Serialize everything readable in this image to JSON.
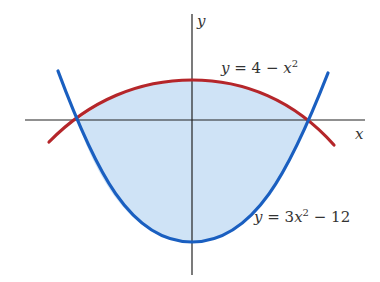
{
  "axes": {
    "x_label": "x",
    "y_label": "y"
  },
  "curves": [
    {
      "name": "upper",
      "equation_prefix": "y = 4 − ",
      "equation_var": "x",
      "equation_exp": "2",
      "equation_suffix": "",
      "color": "#b5262a"
    },
    {
      "name": "lower",
      "equation_prefix": "y = 3",
      "equation_var": "x",
      "equation_exp": "2",
      "equation_suffix": " − 12",
      "color": "#1a5fc0"
    }
  ],
  "region_fill": "#cfe3f6",
  "labels": {
    "upper_eq": {
      "y": "y",
      "eq": " = 4 − ",
      "x": "x",
      "exp": "2"
    },
    "lower_eq": {
      "y": "y",
      "eq": " = 3",
      "x": "x",
      "exp": "2",
      "tail": " − 12"
    }
  }
}
